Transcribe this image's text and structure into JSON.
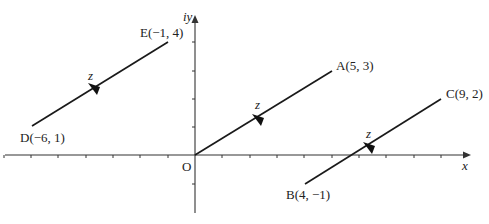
{
  "diagram": {
    "type": "complex-plane-translation",
    "axes": {
      "x_label": "x",
      "y_label": "iy",
      "origin_label": "O",
      "x_ticks": [
        -7,
        -6,
        -5,
        -4,
        -3,
        -2,
        -1,
        1,
        2,
        3,
        4,
        5,
        6,
        7,
        8,
        9,
        10
      ],
      "y_ticks": [
        -2,
        -1,
        1,
        2,
        3,
        4
      ]
    },
    "segments": [
      {
        "from": {
          "name": "O",
          "label": "O"
        },
        "to": {
          "name": "A",
          "label": "A(5, 3)",
          "x": 5,
          "y": 3
        },
        "vector_label": "z"
      },
      {
        "from": {
          "name": "B",
          "label": "B(4, −1)",
          "x": 4,
          "y": -1
        },
        "to": {
          "name": "C",
          "label": "C(9, 2)",
          "x": 9,
          "y": 2
        },
        "vector_label": "z"
      },
      {
        "from": {
          "name": "D",
          "label": "D(−6, 1)",
          "x": -6,
          "y": 1
        },
        "to": {
          "name": "E",
          "label": "E(−1, 4)",
          "x": -1,
          "y": 4
        },
        "vector_label": "z"
      }
    ],
    "colors": {
      "ink": "#1a1a1a",
      "axis": "#333333",
      "background": "#ffffff"
    }
  }
}
